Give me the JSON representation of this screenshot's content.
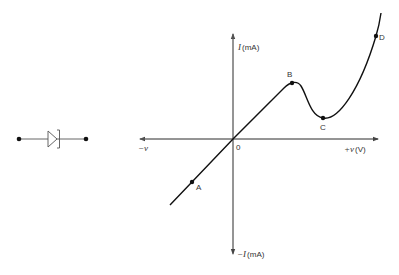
{
  "diagram": {
    "type": "tunnel-diode-iv-characteristic",
    "symbol": {
      "name": "tunnel diode"
    },
    "axes": {
      "y_pos_label_var": "I",
      "y_pos_label_unit": "(mA)",
      "y_neg_label_var": "−I",
      "y_neg_label_unit": "(mA)",
      "x_pos_label_var": "+v",
      "x_pos_label_unit": "(V)",
      "x_neg_label": "−v",
      "origin_label": "0"
    },
    "points": [
      {
        "id": "A",
        "label": "A"
      },
      {
        "id": "B",
        "label": "B"
      },
      {
        "id": "C",
        "label": "C"
      },
      {
        "id": "D",
        "label": "D"
      }
    ],
    "colors": {
      "axis": "#666666",
      "curve": "#111111",
      "text": "#333333"
    }
  }
}
